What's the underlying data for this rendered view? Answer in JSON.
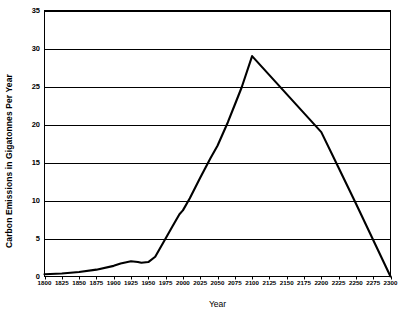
{
  "chart": {
    "type": "line",
    "title": "",
    "xlabel": "Year",
    "ylabel": "Carbon Emissions in Gigatonnes Per Year",
    "line_color": "#000000",
    "grid_color": "#000000",
    "background": "#ffffff"
  },
  "chart_data": {
    "type": "line",
    "title": "",
    "xlabel": "Year",
    "ylabel": "Carbon Emissions in Gigatonnes Per Year",
    "xlim": [
      1800,
      2300
    ],
    "ylim": [
      0,
      35
    ],
    "xticks": [
      1800,
      1825,
      1850,
      1875,
      1900,
      1925,
      1950,
      1975,
      2000,
      2025,
      2050,
      2075,
      2100,
      2125,
      2150,
      2175,
      2200,
      2225,
      2250,
      2275,
      2300
    ],
    "xtick_labels": [
      "1800",
      "1825",
      "1850",
      "1875",
      "1900",
      "1925",
      "1950",
      "1975",
      "2000",
      "2025",
      "2050",
      "2075",
      "2100",
      "2125",
      "2150",
      "2175",
      "2200",
      "2225",
      "2250",
      "2275",
      "2300"
    ],
    "yticks": [
      0,
      5,
      10,
      15,
      20,
      25,
      30,
      35
    ],
    "ytick_labels": [
      "0",
      "5",
      "10",
      "15",
      "20",
      "25",
      "30",
      "35"
    ],
    "grid": "horizontal",
    "legend": "none",
    "series": [
      {
        "name": "Carbon Emissions",
        "x": [
          1800,
          1825,
          1850,
          1875,
          1900,
          1910,
          1925,
          1935,
          1940,
          1950,
          1960,
          1975,
          1985,
          1995,
          2000,
          2010,
          2025,
          2040,
          2050,
          2065,
          2075,
          2085,
          2100,
          2125,
          2150,
          2175,
          2200,
          2225,
          2250,
          2275,
          2300
        ],
        "y": [
          0.3,
          0.4,
          0.6,
          0.9,
          1.4,
          1.7,
          2.0,
          1.9,
          1.8,
          1.9,
          2.6,
          5.0,
          6.6,
          8.2,
          8.7,
          10.3,
          13.0,
          15.6,
          17.2,
          20.3,
          22.6,
          24.9,
          29.0,
          26.5,
          24.0,
          21.5,
          19.0,
          14.3,
          9.6,
          4.8,
          0.0
        ]
      }
    ]
  }
}
